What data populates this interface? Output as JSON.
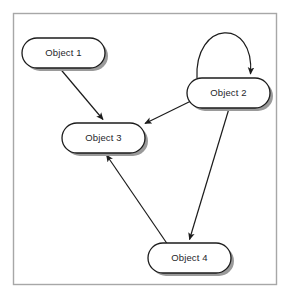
{
  "figure": {
    "type": "object-graph-diagram",
    "background_color": "#ffffff",
    "frame": {
      "x": 13.5,
      "y": 13.5,
      "width": 263,
      "height": 271,
      "stroke_color": "#a7a7a7",
      "stroke_width": 1.4,
      "fill": "#ffffff"
    },
    "node_style": {
      "fill": "#ffffff",
      "stroke_color": "#1c1c1c",
      "stroke_width": 1.3,
      "shadow_color": "#9a9a9a",
      "shadow_offset_x": 3,
      "shadow_offset_y": 3,
      "corner_radius": 15
    },
    "edge_style": {
      "stroke_color": "#1c1c1c",
      "stroke_width": 1.2,
      "arrowhead": "solid-triangle"
    }
  },
  "nodes": [
    {
      "id": "object-1",
      "label": "Object 1",
      "x": 22,
      "y": 38,
      "width": 83,
      "height": 30,
      "cx": 63.5,
      "cy": 53
    },
    {
      "id": "object-2",
      "label": "Object 2",
      "x": 187,
      "y": 78,
      "width": 83,
      "height": 30,
      "cx": 228.5,
      "cy": 93
    },
    {
      "id": "object-3",
      "label": "Object 3",
      "x": 62,
      "y": 123,
      "width": 83,
      "height": 30,
      "cx": 103.5,
      "cy": 138
    },
    {
      "id": "object-4",
      "label": "Object 4",
      "x": 148,
      "y": 243,
      "width": 83,
      "height": 30,
      "cx": 189.5,
      "cy": 258
    }
  ],
  "edges": [
    {
      "id": "edge-object1-object3",
      "from": "object-1",
      "to": "object-3",
      "label": "",
      "kind": "straight",
      "path": "M 60,68.5 L 104.5,121.5"
    },
    {
      "id": "edge-object2-object3",
      "from": "object-2",
      "to": "object-3",
      "label": "",
      "kind": "straight",
      "path": "M 192,101 L 144.5,124.5"
    },
    {
      "id": "edge-object2-object4",
      "from": "object-2",
      "to": "object-4",
      "label": "",
      "kind": "straight",
      "path": "M 229,108.5 L 189,241.5"
    },
    {
      "id": "edge-object4-object3",
      "from": "object-4",
      "to": "object-3",
      "label": "",
      "kind": "straight",
      "path": "M 166,243.5 L 106,154"
    },
    {
      "id": "edge-object2-object2-self-loop",
      "from": "object-2",
      "to": "object-2",
      "label": "",
      "kind": "self-loop-arc",
      "path": "M 197,78.5 C 195,22 253,19 251,77"
    }
  ]
}
